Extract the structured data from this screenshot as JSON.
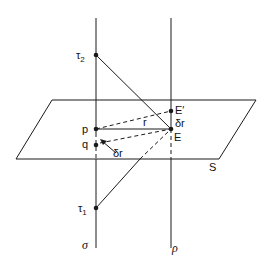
{
  "diagram": {
    "type": "geometric-construction",
    "background": "#ffffff",
    "stroke_color": "#1a1a1a",
    "lines": {
      "sigma": {
        "label": "σ",
        "x": 96,
        "y1": 18,
        "y2": 248
      },
      "rho": {
        "label": "ρ",
        "x": 171,
        "y1": 18,
        "y2": 248
      }
    },
    "plane": {
      "label": "S",
      "corners": [
        [
          52,
          100
        ],
        [
          256,
          100
        ],
        [
          219,
          159
        ],
        [
          16,
          159
        ]
      ]
    },
    "points": {
      "tau2": {
        "label": "τ",
        "sub": "2",
        "x": 96,
        "y": 55
      },
      "tau1": {
        "label": "τ",
        "sub": "1",
        "x": 96,
        "y": 208
      },
      "p": {
        "label": "p",
        "x": 96,
        "y": 129
      },
      "q": {
        "label": "q",
        "x": 96,
        "y": 145
      },
      "E": {
        "label": "E",
        "x": 171,
        "y": 129
      },
      "E_prime": {
        "label": "E′",
        "x": 171,
        "y": 111
      }
    },
    "segment_labels": {
      "r": "r",
      "delta_r_vertical": "δr",
      "delta_r_arrow": "δr"
    }
  }
}
